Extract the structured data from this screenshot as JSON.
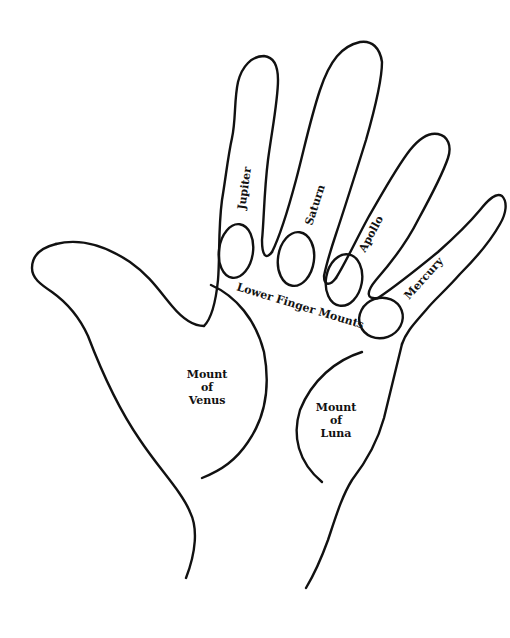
{
  "diagram": {
    "colors": {
      "line": "#111111",
      "background": "#ffffff",
      "text": "#111111"
    },
    "labels": {
      "jupiter": "Jupiter",
      "saturn": "Saturn",
      "apollo": "Apollo",
      "mercury": "Mercury",
      "lower_finger_mounts": "Lower Finger Mounts",
      "venus": [
        "Mount",
        "of",
        "Venus"
      ],
      "luna": [
        "Mount",
        "of",
        "Luna"
      ]
    }
  }
}
